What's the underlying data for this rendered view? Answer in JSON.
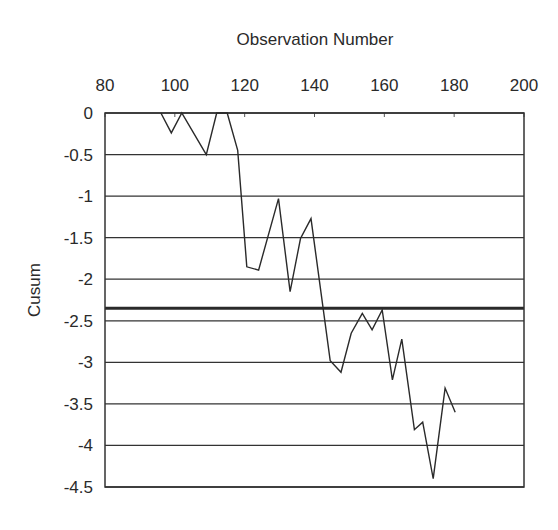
{
  "chart_data": {
    "type": "line",
    "title": "",
    "xlabel": "Observation Number",
    "ylabel": "Cusum",
    "x_axis_position": "top",
    "xlim": [
      80,
      200
    ],
    "ylim": [
      -4.5,
      0
    ],
    "x_ticks": [
      80,
      100,
      120,
      140,
      160,
      180,
      200
    ],
    "y_ticks": [
      0,
      -0.5,
      -1,
      -1.5,
      -2,
      -2.5,
      -3,
      -3.5,
      -4,
      -4.5
    ],
    "x_tick_labels": [
      "80",
      "100",
      "120",
      "140",
      "160",
      "180",
      "200"
    ],
    "y_tick_labels": [
      "0",
      "-0.5",
      "-1",
      "-1.5",
      "-2",
      "-2.5",
      "-3",
      "-3.5",
      "-4",
      "-4.5"
    ],
    "grid": {
      "horizontal": true,
      "vertical": false
    },
    "legend": null,
    "reference_line": {
      "y": -2.35,
      "style": "thick"
    },
    "series": [
      {
        "name": "Cusum",
        "color": "#2a2a2a",
        "x": [
          96,
          99,
          102,
          109,
          112,
          115,
          118,
          120.6,
          124,
          129.7,
          133,
          136,
          139,
          144.5,
          147.6,
          150.5,
          153.7,
          156.5,
          159.4,
          162.3,
          165,
          168.6,
          171,
          174,
          177.4,
          180.3
        ],
        "values": [
          0,
          -0.24,
          0,
          -0.5,
          0,
          0,
          -0.45,
          -1.85,
          -1.89,
          -1.03,
          -2.15,
          -1.51,
          -1.27,
          -2.98,
          -3.12,
          -2.65,
          -2.41,
          -2.61,
          -2.37,
          -3.21,
          -2.72,
          -3.81,
          -3.72,
          -4.4,
          -3.31,
          -3.6
        ]
      }
    ]
  }
}
